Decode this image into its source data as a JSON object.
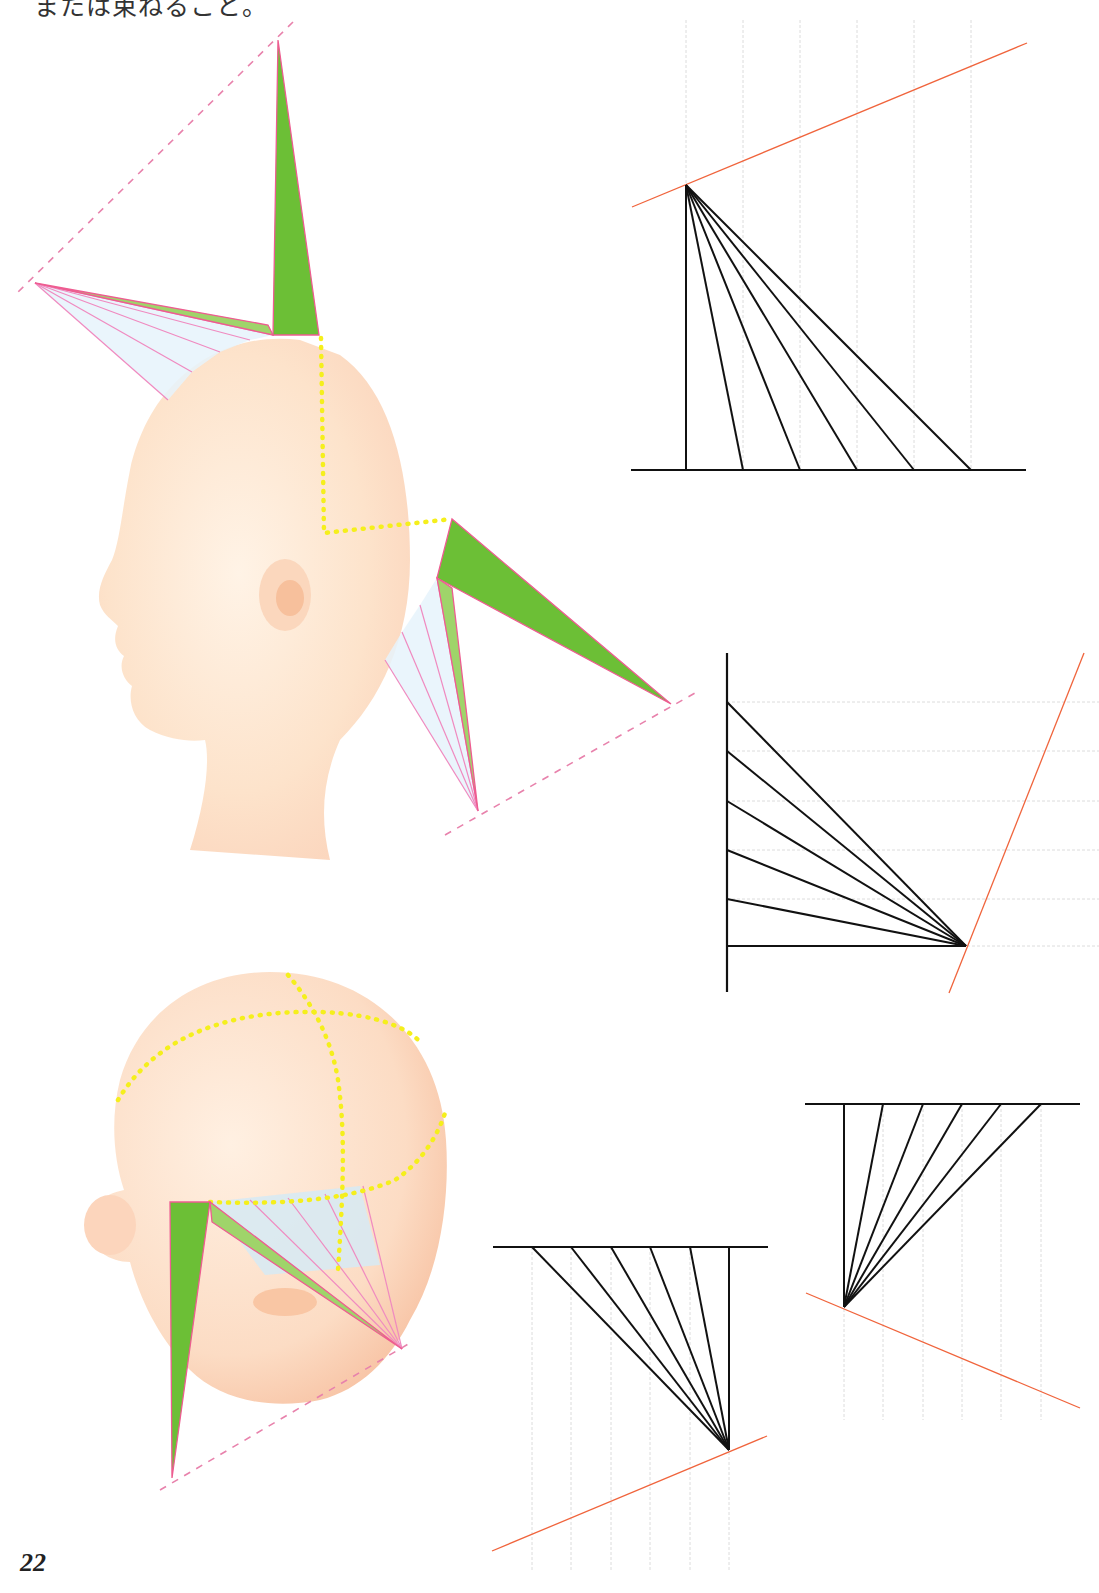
{
  "page": {
    "caption": "または束ねること。",
    "page_number": "22"
  },
  "colors": {
    "green": "#6cbf36",
    "green_light": "#9fd46a",
    "pink": "#ee5c91",
    "pink_fan": "#f08ac0",
    "guide_dash": "#e882ac",
    "fan_shade": "#e6f3fb",
    "yellow_dots": "#f5ef1c",
    "skin": "#fde6cf",
    "skin_shade": "#f9c9a6",
    "grid": "#dcdcdc",
    "black": "#111111",
    "red": "#f0643c"
  },
  "illustrations": [
    {
      "name": "side-profile-head",
      "spike": {
        "tip": [
          278,
          40
        ],
        "base": [
          [
            273,
            335
          ],
          [
            319,
            335
          ]
        ]
      },
      "fan": {
        "apex": [
          35,
          283
        ],
        "targets": [
          [
            273,
            335
          ],
          [
            250,
            340
          ],
          [
            220,
            352
          ],
          [
            192,
            372
          ],
          [
            168,
            400
          ]
        ]
      },
      "guide": [
        [
          293,
          22
        ],
        [
          15,
          295
        ]
      ],
      "yellow_path": "M321 338 L324 533 L452 519"
    },
    {
      "name": "nape-section",
      "spike_upper": [
        [
          452,
          519
        ],
        [
          437,
          578
        ],
        [
          671,
          704
        ]
      ],
      "spike_lower": [
        [
          437,
          578
        ],
        [
          452,
          588
        ],
        [
          478,
          811
        ]
      ],
      "fan": {
        "apex": [
          478,
          811
        ],
        "targets": [
          [
            437,
            578
          ],
          [
            420,
            605
          ],
          [
            402,
            632
          ],
          [
            385,
            660
          ]
        ]
      },
      "guide": [
        [
          445,
          835
        ],
        [
          695,
          693
        ]
      ]
    },
    {
      "name": "back-head",
      "spike_left": [
        [
          170,
          1202
        ],
        [
          210,
          1202
        ],
        [
          172,
          1478
        ]
      ],
      "spike_right": [
        [
          210,
          1202
        ],
        [
          212,
          1222
        ],
        [
          402,
          1349
        ]
      ],
      "fan": {
        "apex": [
          402,
          1349
        ],
        "targets": [
          [
            250,
            1200
          ],
          [
            288,
            1198
          ],
          [
            325,
            1194
          ],
          [
            363,
            1186
          ]
        ]
      },
      "guide": [
        [
          160,
          1490
        ],
        [
          410,
          1343
        ]
      ]
    }
  ],
  "diagrams": [
    {
      "name": "vertical-fan-diagram",
      "apex": [
        686,
        185
      ],
      "baseline": {
        "y": 470,
        "x1": 631,
        "x2": 1026
      },
      "ends": [
        [
          686,
          470
        ],
        [
          743,
          470
        ],
        [
          800,
          470
        ],
        [
          857,
          470
        ],
        [
          914,
          470
        ],
        [
          971,
          470
        ]
      ],
      "grid": {
        "orientation": "vertical",
        "positions": [
          686,
          743,
          800,
          857,
          914,
          971
        ],
        "from": 20,
        "to": 470
      },
      "red_line": [
        [
          632,
          207
        ],
        [
          1027,
          43
        ]
      ]
    },
    {
      "name": "horizontal-fan-diagram",
      "apex": [
        966,
        946
      ],
      "axis": {
        "x": 727,
        "y1": 653,
        "y2": 992
      },
      "ends": [
        [
          727,
          702
        ],
        [
          727,
          751
        ],
        [
          727,
          801
        ],
        [
          727,
          850
        ],
        [
          727,
          899
        ],
        [
          727,
          946
        ]
      ],
      "grid": {
        "orientation": "horizontal",
        "positions": [
          702,
          751,
          801,
          850,
          899,
          946
        ],
        "from": 727,
        "to": 1099
      },
      "red_line": [
        [
          949,
          993
        ],
        [
          1084,
          653
        ]
      ]
    },
    {
      "name": "inverted-fan-left",
      "apex": [
        729,
        1450
      ],
      "topline": {
        "y": 1247,
        "x1": 493,
        "x2": 768
      },
      "ends": [
        [
          532,
          1247
        ],
        [
          571,
          1247
        ],
        [
          611,
          1247
        ],
        [
          650,
          1247
        ],
        [
          690,
          1247
        ],
        [
          729,
          1247
        ]
      ],
      "grid": {
        "orientation": "vertical",
        "positions": [
          532,
          571,
          611,
          650,
          690,
          729
        ],
        "from": 1247,
        "to": 1572
      },
      "red_line": [
        [
          492,
          1551
        ],
        [
          767,
          1436
        ]
      ]
    },
    {
      "name": "inverted-fan-right",
      "apex": [
        844,
        1307
      ],
      "topline": {
        "y": 1104,
        "x1": 805,
        "x2": 1080
      },
      "ends": [
        [
          844,
          1104
        ],
        [
          883,
          1104
        ],
        [
          923,
          1104
        ],
        [
          962,
          1104
        ],
        [
          1001,
          1104
        ],
        [
          1041,
          1104
        ]
      ],
      "grid": {
        "orientation": "vertical",
        "positions": [
          844,
          883,
          923,
          962,
          1001,
          1041
        ],
        "from": 1104,
        "to": 1420
      },
      "red_line": [
        [
          806,
          1293
        ],
        [
          1080,
          1408
        ]
      ]
    }
  ]
}
